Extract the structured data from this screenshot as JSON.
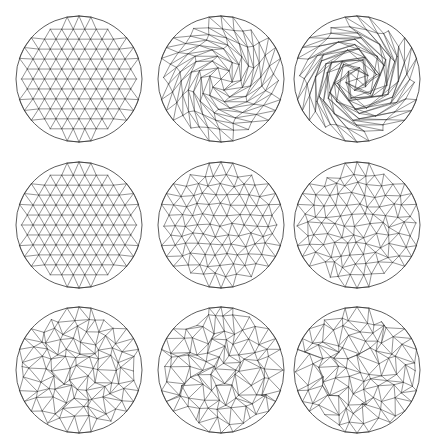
{
  "figure": {
    "width": 432,
    "height": 446,
    "background": "#ffffff",
    "stroke_color": "#3a3a3a",
    "layout": {
      "rows": 3,
      "cols": 3
    },
    "panels": [
      {
        "id": "r1c1",
        "row": 1,
        "col": 1,
        "cx": 79,
        "cy": 79,
        "r": 63,
        "mesh": "regular",
        "twist": 0.0,
        "jitter": 0.0
      },
      {
        "id": "r1c2",
        "row": 1,
        "col": 2,
        "cx": 221,
        "cy": 79,
        "r": 63,
        "mesh": "swirl",
        "twist": 2.2,
        "jitter": 0.0
      },
      {
        "id": "r1c3",
        "row": 1,
        "col": 3,
        "cx": 357,
        "cy": 79,
        "r": 63,
        "mesh": "swirl",
        "twist": 4.6,
        "jitter": 0.0
      },
      {
        "id": "r2c1",
        "row": 2,
        "col": 1,
        "cx": 79,
        "cy": 225,
        "r": 63,
        "mesh": "regular",
        "twist": 0.0,
        "jitter": 0.0
      },
      {
        "id": "r2c2",
        "row": 2,
        "col": 2,
        "cx": 221,
        "cy": 225,
        "r": 63,
        "mesh": "perturbed",
        "twist": 0.0,
        "jitter": 0.18
      },
      {
        "id": "r2c3",
        "row": 2,
        "col": 3,
        "cx": 357,
        "cy": 225,
        "r": 63,
        "mesh": "perturbed",
        "twist": 0.0,
        "jitter": 0.28
      },
      {
        "id": "r3c1",
        "row": 3,
        "col": 1,
        "cx": 79,
        "cy": 370,
        "r": 63,
        "mesh": "random",
        "twist": 0.0,
        "jitter": 0.42
      },
      {
        "id": "r3c2",
        "row": 3,
        "col": 2,
        "cx": 221,
        "cy": 370,
        "r": 63,
        "mesh": "random",
        "twist": 0.0,
        "jitter": 0.5
      },
      {
        "id": "r3c3",
        "row": 3,
        "col": 3,
        "cx": 357,
        "cy": 370,
        "r": 63,
        "mesh": "random",
        "twist": 0.0,
        "jitter": 0.55
      }
    ],
    "grid_spacing": 11.5
  }
}
